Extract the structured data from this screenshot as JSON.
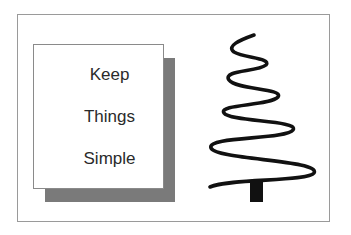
{
  "card": {
    "lines": [
      "Keep",
      "Things",
      "Simple"
    ]
  },
  "colors": {
    "frame_border": "#9a9a9a",
    "shadow": "#7a7a7a",
    "text": "#2a2a2a",
    "tree": "#111111"
  },
  "illustration": {
    "icon": "spiral-christmas-tree-icon"
  }
}
